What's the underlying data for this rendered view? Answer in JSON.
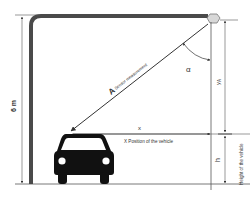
{
  "diagram": {
    "type": "sensor-geometry",
    "labels": {
      "pole_height": "6 m",
      "vector_letter": "A",
      "vector_caption": "Sensor measurement",
      "angle": "α",
      "y_a_main": "y",
      "y_a_sub": "A",
      "x_symbol": "x",
      "x_caption": "X Position of the vehicle",
      "h_symbol": "h",
      "h_caption": "Height of the vehicle"
    },
    "colors": {
      "pole": "#4a4a4a",
      "line": "#555555",
      "car": "#111111",
      "sensor": "#d8d8d8",
      "text": "#333333"
    }
  }
}
